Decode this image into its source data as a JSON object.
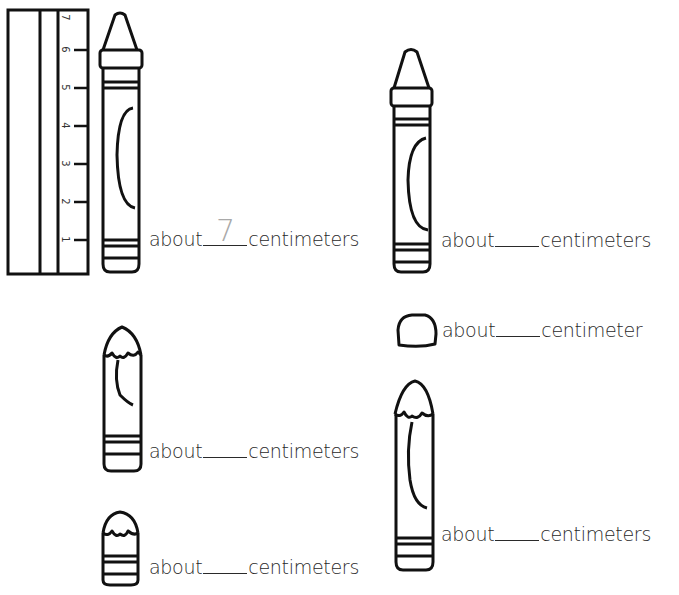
{
  "worksheet": {
    "ruler": {
      "unit": "centimeters",
      "ticks": [
        "1",
        "2",
        "3",
        "4",
        "5",
        "6",
        "7"
      ]
    },
    "items": [
      {
        "id": "crayon-full-left",
        "prefix": "about",
        "answer": "7",
        "suffix": "centimeters"
      },
      {
        "id": "crayon-full-right",
        "prefix": "about",
        "answer": "",
        "suffix": "centimeters"
      },
      {
        "id": "eraser-stub",
        "prefix": "about",
        "answer": "",
        "suffix": "centimeter"
      },
      {
        "id": "crayon-worn-left",
        "prefix": "about",
        "answer": "",
        "suffix": "centimeters"
      },
      {
        "id": "crayon-worn-right",
        "prefix": "about",
        "answer": "",
        "suffix": "centimeters"
      },
      {
        "id": "crayon-stub",
        "prefix": "about",
        "answer": "",
        "suffix": "centimeters"
      }
    ]
  }
}
